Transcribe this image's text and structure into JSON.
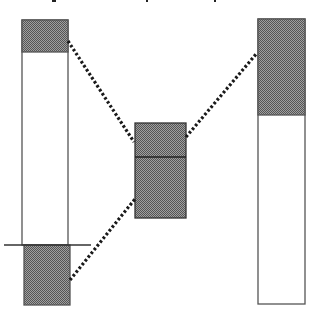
{
  "diagram": {
    "colors": {
      "outline": "#555555",
      "hatch_fill": "#8a8a8a",
      "hatch_dark": "#555555",
      "dotted_line": "#1a1a1a",
      "background": "#ffffff"
    },
    "top_text_fragments": [
      {
        "x": 52,
        "y": 0,
        "w": 4,
        "h": 2
      },
      {
        "x": 146,
        "y": 0,
        "w": 2,
        "h": 2
      },
      {
        "x": 214,
        "y": 0,
        "w": 2,
        "h": 2
      }
    ],
    "left_column": {
      "x": 22,
      "y": 20,
      "width": 46,
      "height": 225,
      "shaded_top": {
        "y": 20,
        "height": 32
      },
      "baseline": {
        "x1": 4,
        "x2": 91,
        "y": 245
      },
      "shaded_bottom": {
        "x": 24,
        "y": 245,
        "width": 46,
        "height": 60
      }
    },
    "middle_box": {
      "x": 135,
      "y": 123,
      "width": 51,
      "height": 95,
      "divider_y": 157
    },
    "right_column": {
      "x": 258,
      "y": 19,
      "width": 47,
      "height": 285,
      "shaded_top": {
        "y": 19,
        "height": 96
      }
    },
    "connectors": [
      {
        "name": "upper-left-connector",
        "x1": 68,
        "y1": 41,
        "x2": 134,
        "y2": 142
      },
      {
        "name": "right-connector",
        "x1": 186,
        "y1": 137,
        "x2": 257,
        "y2": 53
      },
      {
        "name": "lower-left-connector",
        "x1": 70,
        "y1": 280,
        "x2": 135,
        "y2": 199
      }
    ]
  }
}
